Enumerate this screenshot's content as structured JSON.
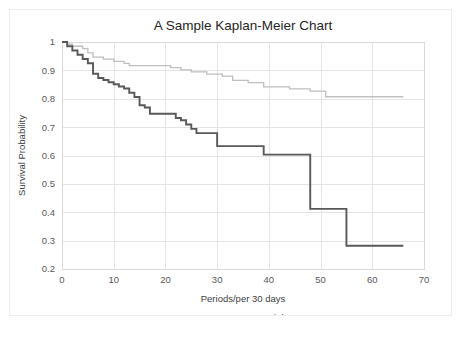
{
  "chart_data": {
    "type": "line",
    "subtype": "kaplan-meier-step",
    "title": "A Sample Kaplan-Meier Chart",
    "xlabel": "Periods/per 30 days",
    "ylabel": "Survival Probability",
    "xlim": [
      0,
      70
    ],
    "ylim": [
      0.2,
      1
    ],
    "xticks": [
      0,
      10,
      20,
      30,
      40,
      50,
      60,
      70
    ],
    "xtick_labels": [
      "0",
      "10",
      "20",
      "30",
      "40",
      "50",
      "60",
      "70"
    ],
    "yticks": [
      0.2,
      0.3,
      0.4,
      0.5,
      0.6,
      0.7,
      0.8,
      0.9,
      1
    ],
    "ytick_labels": [
      "0.2",
      "0.3",
      "0.4",
      "0.5",
      "0.6",
      "0.7",
      "0.8",
      "0.9",
      "1"
    ],
    "grid": "both",
    "legend_position": "bottom",
    "series": [
      {
        "name": "Low",
        "color": "#bfbfbf",
        "width": 1.3,
        "x": [
          0,
          1,
          1,
          2,
          2,
          4,
          4,
          5,
          5,
          6,
          6,
          8,
          8,
          10,
          10,
          12,
          12,
          13,
          13,
          15,
          15,
          17,
          17,
          21,
          21,
          23,
          23,
          25,
          25,
          28,
          28,
          31,
          31,
          33,
          33,
          36,
          36,
          38,
          38,
          39,
          39,
          42,
          42,
          44,
          44,
          46,
          46,
          48,
          48,
          51,
          51,
          66
        ],
        "y": [
          1,
          1,
          0.992,
          0.992,
          0.985,
          0.985,
          0.977,
          0.977,
          0.962,
          0.962,
          0.947,
          0.947,
          0.94,
          0.94,
          0.932,
          0.932,
          0.925,
          0.925,
          0.917,
          0.917,
          0.917,
          0.917,
          0.917,
          0.917,
          0.91,
          0.91,
          0.902,
          0.902,
          0.895,
          0.895,
          0.887,
          0.887,
          0.88,
          0.88,
          0.865,
          0.865,
          0.857,
          0.857,
          0.857,
          0.857,
          0.842,
          0.842,
          0.842,
          0.842,
          0.835,
          0.835,
          0.835,
          0.835,
          0.827,
          0.827,
          0.807,
          0.807
        ]
      },
      {
        "name": "High",
        "color": "#595959",
        "width": 1.9,
        "x": [
          0,
          1,
          1,
          2,
          2,
          3,
          3,
          4,
          4,
          5,
          5,
          6,
          6,
          7,
          7,
          8,
          8,
          9,
          9,
          10,
          10,
          11,
          11,
          12,
          12,
          13,
          13,
          14,
          14,
          15,
          15,
          16,
          16,
          17,
          17,
          21,
          21,
          22,
          22,
          23,
          23,
          24,
          24,
          25,
          25,
          26,
          26,
          27,
          27,
          30,
          30,
          39,
          39,
          48,
          48,
          55,
          55,
          66
        ],
        "y": [
          1,
          1,
          0.985,
          0.985,
          0.97,
          0.97,
          0.955,
          0.955,
          0.94,
          0.94,
          0.925,
          0.925,
          0.888,
          0.888,
          0.873,
          0.873,
          0.866,
          0.866,
          0.858,
          0.858,
          0.851,
          0.851,
          0.843,
          0.843,
          0.836,
          0.836,
          0.821,
          0.821,
          0.806,
          0.806,
          0.777,
          0.777,
          0.769,
          0.769,
          0.747,
          0.747,
          0.747,
          0.747,
          0.732,
          0.732,
          0.724,
          0.724,
          0.709,
          0.709,
          0.694,
          0.694,
          0.679,
          0.679,
          0.679,
          0.679,
          0.633,
          0.633,
          0.603,
          0.603,
          0.412,
          0.412,
          0.282,
          0.282
        ]
      }
    ]
  }
}
